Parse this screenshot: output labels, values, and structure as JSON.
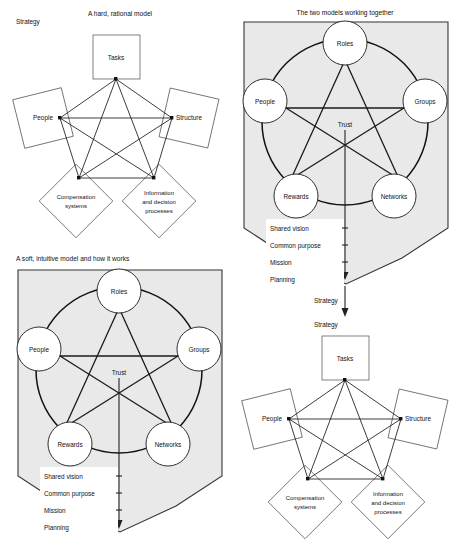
{
  "figure": {
    "kind": "four-panel organizational model diagram"
  },
  "panels": {
    "top_left": {
      "title": "A hard, rational model",
      "strategy_label": "Strategy",
      "nodes": [
        {
          "id": "tasks",
          "label": "Tasks",
          "shape": "square"
        },
        {
          "id": "people",
          "label": "People",
          "shape": "tilted-square"
        },
        {
          "id": "structure",
          "label": "Structure",
          "shape": "tilted-square"
        },
        {
          "id": "compensation",
          "label": "Compensation\nsystems",
          "line1": "Compensation",
          "line2": "systems",
          "shape": "diamond"
        },
        {
          "id": "information",
          "label": "Information and decision processes",
          "line1": "Information",
          "line2": "and decision",
          "line3": "processes",
          "shape": "diamond"
        }
      ]
    },
    "top_right": {
      "title": "The two models working together",
      "center_label": "Trust",
      "nodes": [
        {
          "id": "roles",
          "label": "Roles"
        },
        {
          "id": "people",
          "label": "People"
        },
        {
          "id": "groups",
          "label": "Groups"
        },
        {
          "id": "rewards",
          "label": "Rewards"
        },
        {
          "id": "networks",
          "label": "Networks"
        }
      ],
      "list": [
        "Shared vision",
        "Common purpose",
        "Mission",
        "Planning"
      ],
      "outflow_label": "Strategy"
    },
    "bottom_left": {
      "title": "A soft, intuitive model and how it works",
      "center_label": "Trust",
      "nodes": [
        {
          "id": "roles",
          "label": "Roles"
        },
        {
          "id": "people",
          "label": "People"
        },
        {
          "id": "groups",
          "label": "Groups"
        },
        {
          "id": "rewards",
          "label": "Rewards"
        },
        {
          "id": "networks",
          "label": "Networks"
        }
      ],
      "list": [
        "Shared vision",
        "Common purpose",
        "Mission",
        "Planning"
      ]
    },
    "bottom_right": {
      "strategy_label": "Strategy",
      "nodes": [
        {
          "id": "tasks",
          "label": "Tasks",
          "shape": "square"
        },
        {
          "id": "people",
          "label": "People",
          "shape": "tilted-square"
        },
        {
          "id": "structure",
          "label": "Structure",
          "shape": "tilted-square"
        },
        {
          "id": "compensation",
          "line1": "Compensation",
          "line2": "systems",
          "shape": "diamond"
        },
        {
          "id": "information",
          "line1": "Information",
          "line2": "and decision",
          "line3": "processes",
          "shape": "diamond"
        }
      ]
    }
  },
  "colors": {
    "panel_fill": "#e9e9e9",
    "stroke": "#1a1a1a",
    "shape_stroke": "#4a4a4a",
    "page_bg": "#ffffff"
  }
}
